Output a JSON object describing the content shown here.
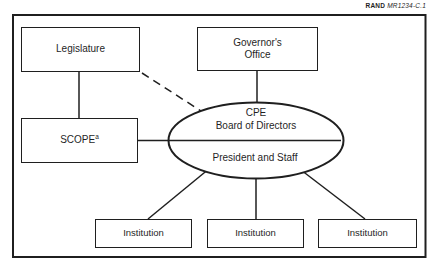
{
  "figure_label": {
    "prefix": "RAND",
    "code": "MR1234-C.1"
  },
  "diagram": {
    "nodes": {
      "legislature": {
        "label": "Legislature"
      },
      "governors_office": {
        "label": "Governor's\nOffice"
      },
      "scope": {
        "label": "SCOPE",
        "superscript": "a"
      },
      "cpe_board": {
        "label": "CPE\nBoard of Directors"
      },
      "president_staff": {
        "label": "President and Staff"
      },
      "institutions": [
        {
          "label": "Institution"
        },
        {
          "label": "Institution"
        },
        {
          "label": "Institution"
        }
      ]
    },
    "edges": [
      {
        "from": "legislature",
        "to": "scope",
        "style": "solid"
      },
      {
        "from": "legislature",
        "to": "cpe_board",
        "style": "dashed"
      },
      {
        "from": "governors_office",
        "to": "cpe_board",
        "style": "solid"
      },
      {
        "from": "scope",
        "to": "cpe_board",
        "style": "solid"
      },
      {
        "from": "president_staff",
        "to": "institutions.0",
        "style": "solid"
      },
      {
        "from": "president_staff",
        "to": "institutions.1",
        "style": "solid"
      },
      {
        "from": "president_staff",
        "to": "institutions.2",
        "style": "solid"
      }
    ]
  },
  "colors": {
    "line": "#1f1f1f",
    "background": "#ffffff",
    "text": "#1f1f1f"
  }
}
